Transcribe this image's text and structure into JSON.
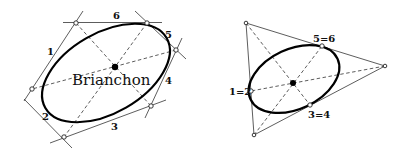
{
  "figures": [
    {
      "id": "hexagon-case",
      "title": "Brianchon",
      "conic": {
        "cx": 106,
        "cy": 73,
        "rx": 70,
        "ry": 40,
        "rotate": -30
      },
      "vertices": [
        [
          76,
          23
        ],
        [
          147,
          23
        ],
        [
          176,
          50
        ],
        [
          151,
          106
        ],
        [
          64,
          137
        ],
        [
          32,
          89
        ]
      ],
      "brianchon_point": [
        115,
        67
      ],
      "side_labels": [
        {
          "text": "1",
          "x": 47,
          "y": 55
        },
        {
          "text": "2",
          "x": 42,
          "y": 120
        },
        {
          "text": "3",
          "x": 111,
          "y": 130
        },
        {
          "text": "4",
          "x": 165,
          "y": 84
        },
        {
          "text": "5",
          "x": 165,
          "y": 38
        },
        {
          "text": "6",
          "x": 113,
          "y": 19
        }
      ]
    },
    {
      "id": "triangle-case",
      "conic": {
        "cx": 294,
        "cy": 79,
        "rx": 48,
        "ry": 30,
        "rotate": -25
      },
      "vertices": [
        [
          246,
          23
        ],
        [
          385,
          66
        ],
        [
          254,
          135
        ]
      ],
      "tangent_points": [
        [
          322,
          46
        ],
        [
          251,
          91
        ],
        [
          310,
          105
        ]
      ],
      "brianchon_point": [
        293,
        83
      ],
      "point_labels": [
        {
          "text": "5=6",
          "x": 313,
          "y": 42
        },
        {
          "text": "1=2",
          "x": 229,
          "y": 95
        },
        {
          "text": "3=4",
          "x": 308,
          "y": 118
        }
      ]
    }
  ]
}
